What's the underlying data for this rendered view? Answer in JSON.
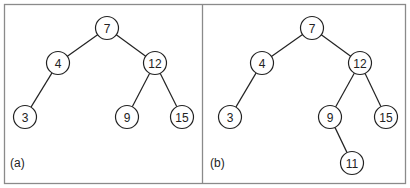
{
  "panels": [
    {
      "label": "(a)",
      "label_pos": [
        10,
        167
      ],
      "nodes": [
        {
          "id": "7",
          "x": 107,
          "y": 28
        },
        {
          "id": "4",
          "x": 58,
          "y": 63
        },
        {
          "id": "12",
          "x": 155,
          "y": 63
        },
        {
          "id": "3",
          "x": 25,
          "y": 117
        },
        {
          "id": "9",
          "x": 127,
          "y": 117
        },
        {
          "id": "15",
          "x": 182,
          "y": 117
        }
      ],
      "edges": [
        [
          "7",
          "4"
        ],
        [
          "7",
          "12"
        ],
        [
          "4",
          "3"
        ],
        [
          "12",
          "9"
        ],
        [
          "12",
          "15"
        ]
      ]
    },
    {
      "label": "(b)",
      "label_pos": [
        210,
        167
      ],
      "nodes": [
        {
          "id": "7",
          "x": 312,
          "y": 28
        },
        {
          "id": "4",
          "x": 262,
          "y": 63
        },
        {
          "id": "12",
          "x": 360,
          "y": 63
        },
        {
          "id": "3",
          "x": 230,
          "y": 117
        },
        {
          "id": "9",
          "x": 330,
          "y": 117
        },
        {
          "id": "15",
          "x": 386,
          "y": 117
        },
        {
          "id": "11",
          "x": 352,
          "y": 163
        }
      ],
      "edges": [
        [
          "7",
          "4"
        ],
        [
          "7",
          "12"
        ],
        [
          "4",
          "3"
        ],
        [
          "12",
          "9"
        ],
        [
          "12",
          "15"
        ],
        [
          "9",
          "11"
        ]
      ]
    }
  ],
  "node_radius": 11.5
}
